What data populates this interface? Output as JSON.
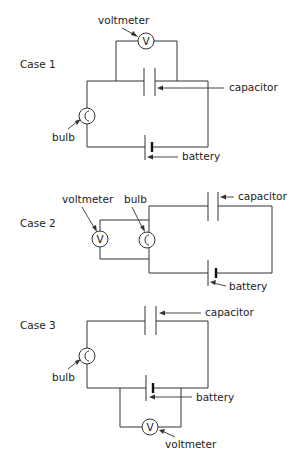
{
  "figure": {
    "cases": [
      {
        "label": "Case 1",
        "labels": {
          "voltmeter": "voltmeter",
          "capacitor": "capacitor",
          "bulb": "bulb",
          "battery": "battery"
        },
        "voltmeter_symbol": "V",
        "voltmeter_across": "capacitor"
      },
      {
        "label": "Case 2",
        "labels": {
          "voltmeter": "voltmeter",
          "bulb": "bulb",
          "capacitor": "capacitor",
          "battery": "battery"
        },
        "voltmeter_symbol": "V",
        "voltmeter_across": "bulb"
      },
      {
        "label": "Case 3",
        "labels": {
          "capacitor": "capacitor",
          "bulb": "bulb",
          "battery": "battery",
          "voltmeter": "voltmeter"
        },
        "voltmeter_symbol": "V",
        "voltmeter_across": "battery"
      }
    ],
    "colors": {
      "line": "#333333",
      "text": "#222222",
      "background": "#ffffff"
    }
  }
}
